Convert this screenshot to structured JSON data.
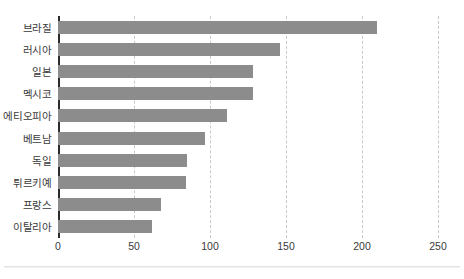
{
  "chart_data": {
    "type": "bar",
    "orientation": "horizontal",
    "title": "",
    "subtitle": "",
    "xlabel": "",
    "ylabel": "",
    "categories": [
      "브라질",
      "러시아",
      "일본",
      "멕시코",
      "에티오피아",
      "베트남",
      "독일",
      "튀르키예",
      "프랑스",
      "이탈리아"
    ],
    "values": [
      210,
      146,
      128,
      128,
      111,
      97,
      85,
      84,
      68,
      62
    ],
    "series": [
      {
        "name": "",
        "values": [
          210,
          146,
          128,
          128,
          111,
          97,
          85,
          84,
          68,
          62
        ]
      }
    ],
    "xlim": [
      0,
      250
    ],
    "xticks": [
      0,
      50,
      100,
      150,
      200,
      250
    ],
    "xtick_labels": [
      "0",
      "50",
      "100",
      "150",
      "200",
      "250"
    ],
    "grid": "vertical-dashed",
    "legend": "none",
    "bar_color": "#8c8c8c",
    "axis_color": "#2b2b2b",
    "gridline_color": "#c9c9c9",
    "background": "#ffffff",
    "text_color": "#3a3a3a"
  }
}
